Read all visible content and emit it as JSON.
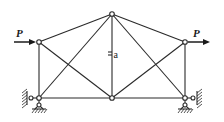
{
  "diagram": {
    "type": "truss",
    "nodes": [
      {
        "id": "left-top",
        "x": 39,
        "y": 42
      },
      {
        "id": "left-bottom",
        "x": 39,
        "y": 98
      },
      {
        "id": "top-center",
        "x": 112,
        "y": 14
      },
      {
        "id": "bottom-center",
        "x": 112,
        "y": 98
      },
      {
        "id": "right-top",
        "x": 185,
        "y": 42
      },
      {
        "id": "right-bottom",
        "x": 185,
        "y": 98
      }
    ],
    "loads": [
      {
        "label": "P",
        "node": "left-top",
        "direction": "right"
      },
      {
        "label": "P",
        "node": "right-top",
        "direction": "right"
      }
    ],
    "dimension_label": "a",
    "supports": [
      {
        "node": "left-bottom",
        "type": "pin-with-side-wall"
      },
      {
        "node": "right-bottom",
        "type": "pin-with-side-wall"
      }
    ],
    "colors": {
      "line": "#2a2a2a",
      "background": "#ffffff"
    }
  }
}
